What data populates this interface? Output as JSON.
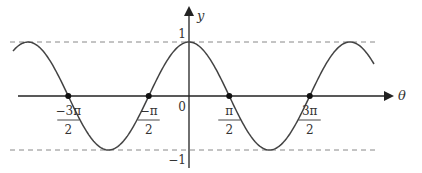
{
  "chart_data": {
    "type": "line",
    "title": "",
    "function": "y = cos(θ)",
    "xlabel": "θ",
    "ylabel": "y",
    "x_ticks": [
      {
        "value": -4.712,
        "num": "−3π",
        "den": "2"
      },
      {
        "value": -1.571,
        "num": "−π",
        "den": "2"
      },
      {
        "value": 1.571,
        "num": "π",
        "den": "2"
      },
      {
        "value": 4.712,
        "num": "3π",
        "den": "2"
      }
    ],
    "origin_label": "0",
    "y_ticks": [
      {
        "value": 1,
        "label": "1"
      },
      {
        "value": -1,
        "label": "−1"
      }
    ],
    "xlim": [
      -7.1,
      7.4
    ],
    "ylim": [
      -1.1,
      1.1
    ],
    "reference_lines": [
      {
        "y": 1,
        "style": "dashed"
      },
      {
        "y": -1,
        "style": "dashed"
      }
    ],
    "marked_points": [
      {
        "x": -4.712,
        "y": 0
      },
      {
        "x": -1.571,
        "y": 0
      },
      {
        "x": 1.571,
        "y": 0
      },
      {
        "x": 4.712,
        "y": 0
      }
    ],
    "x": [
      -6.283,
      -4.712,
      -3.142,
      -1.571,
      0,
      1.571,
      3.142,
      4.712,
      6.283
    ],
    "values": [
      1,
      0,
      -1,
      0,
      1,
      0,
      -1,
      0,
      1
    ],
    "grid": false,
    "legend": null
  },
  "style": {
    "curve_color": "#444444",
    "axis_color": "#222222",
    "dash_color": "#888888"
  }
}
